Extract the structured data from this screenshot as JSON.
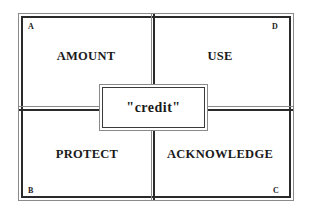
{
  "diagram": {
    "center": {
      "label": "\"credit\""
    },
    "quadrants": [
      {
        "id": "A",
        "position": "top-left",
        "label": "AMOUNT",
        "corner_letter": "A"
      },
      {
        "id": "D",
        "position": "top-right",
        "label": "USE",
        "corner_letter": "D"
      },
      {
        "id": "B",
        "position": "bottom-left",
        "label": "PROTECT",
        "corner_letter": "B"
      },
      {
        "id": "C",
        "position": "bottom-right",
        "label": "ACKNOWLEDGE",
        "corner_letter": "C"
      }
    ],
    "colors": {
      "line_dark": "#2a2a2a",
      "line_light": "#8a8a8a",
      "background": "#ffffff"
    }
  }
}
